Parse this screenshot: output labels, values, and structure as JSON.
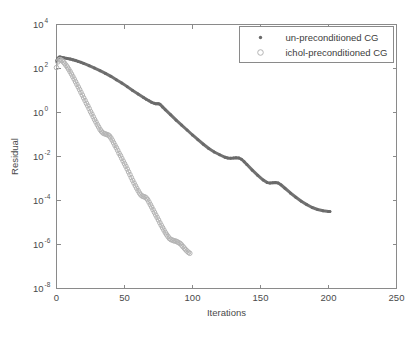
{
  "chart_data": {
    "type": "line",
    "title": "",
    "xlabel": "Iterations",
    "ylabel": "Residual",
    "yscale": "log",
    "xlim": [
      0,
      250
    ],
    "ylim": [
      1e-08,
      10000.0
    ],
    "xticks": [
      0,
      50,
      100,
      150,
      200,
      250
    ],
    "xticklabels": [
      "0",
      "50",
      "100",
      "150",
      "200",
      "250"
    ],
    "yticks": [
      10000,
      100,
      1,
      0.01,
      0.0001,
      1e-06,
      1e-08
    ],
    "yticklabels": [
      "10",
      "10",
      "10",
      "10",
      "10",
      "10",
      "10"
    ],
    "ytickexponents": [
      "4",
      "2",
      "0",
      "-2",
      "-4",
      "-6",
      "-8"
    ],
    "grid": false,
    "legend_position": "top-right",
    "legend_entries": [
      {
        "label": "un-preconditioned CG",
        "marker": "asterisk",
        "color": "#6a6a6a"
      },
      {
        "label": "ichol-preconditioned CG",
        "marker": "circle-open",
        "color": "#b4b4b4"
      }
    ],
    "series": [
      {
        "name": "un-preconditioned CG",
        "marker": "asterisk",
        "color": "#6a6a6a",
        "x": [
          0,
          1,
          2,
          3,
          4,
          5,
          6,
          8,
          10,
          12,
          14,
          16,
          18,
          20,
          24,
          28,
          32,
          36,
          40,
          44,
          48,
          52,
          56,
          60,
          64,
          66,
          68,
          70,
          72,
          73,
          74,
          75,
          76,
          78,
          80,
          84,
          88,
          92,
          96,
          100,
          104,
          108,
          112,
          116,
          120,
          124,
          126,
          128,
          130,
          132,
          134,
          136,
          138,
          140,
          144,
          148,
          152,
          155,
          157,
          159,
          161,
          163,
          165,
          168,
          172,
          176,
          180,
          184,
          188,
          192,
          196,
          200,
          201
        ],
        "y": [
          220.0,
          290.0,
          330.0,
          330.0,
          320.0,
          310.0,
          300.0,
          285.0,
          270.0,
          250.0,
          230.0,
          210.0,
          190.0,
          170.0,
          135.0,
          105.0,
          80.0,
          60.0,
          44.0,
          31.0,
          22.0,
          15.0,
          10.0,
          7.0,
          4.8,
          4.0,
          3.4,
          2.9,
          2.6,
          2.5,
          2.5,
          2.5,
          2.4,
          1.8,
          1.35,
          0.78,
          0.45,
          0.27,
          0.16,
          0.095,
          0.058,
          0.036,
          0.023,
          0.016,
          0.012,
          0.0092,
          0.0086,
          0.0084,
          0.0085,
          0.0088,
          0.0086,
          0.0075,
          0.0058,
          0.0043,
          0.0024,
          0.0014,
          0.00085,
          0.00065,
          0.00062,
          0.00064,
          0.00066,
          0.00062,
          0.00052,
          0.00036,
          0.00022,
          0.00014,
          9.2e-05,
          6.5e-05,
          4.8e-05,
          3.9e-05,
          3.4e-05,
          3.2e-05,
          3.2e-05
        ]
      },
      {
        "name": "ichol-preconditioned CG",
        "marker": "circle-open",
        "color": "#b4b4b4",
        "x": [
          0,
          1,
          2,
          3,
          4,
          5,
          6,
          7,
          8,
          9,
          10,
          11,
          12,
          13,
          14,
          15,
          16,
          17,
          18,
          19,
          20,
          21,
          22,
          23,
          24,
          25,
          26,
          27,
          28,
          29,
          30,
          31,
          32,
          33,
          34,
          35,
          36,
          37,
          38,
          39,
          40,
          41,
          42,
          43,
          44,
          45,
          46,
          47,
          48,
          49,
          50,
          51,
          52,
          53,
          54,
          55,
          56,
          57,
          58,
          59,
          60,
          61,
          62,
          63,
          64,
          65,
          66,
          67,
          68,
          69,
          70,
          71,
          72,
          73,
          74,
          75,
          76,
          77,
          78,
          79,
          80,
          81,
          82,
          83,
          84,
          85,
          86,
          87,
          88,
          89,
          90,
          91,
          92,
          93,
          94,
          95,
          96,
          97,
          98
        ],
        "y": [
          110.0,
          200.0,
          250.0,
          250.0,
          230.0,
          200.0,
          170.0,
          140.0,
          115.0,
          92.0,
          72.0,
          56.0,
          43.0,
          33.0,
          25.0,
          19.0,
          14.5,
          11.0,
          8.2,
          6.2,
          4.6,
          3.5,
          2.6,
          2.0,
          1.5,
          1.1,
          0.85,
          0.64,
          0.48,
          0.37,
          0.28,
          0.22,
          0.17,
          0.14,
          0.12,
          0.11,
          0.105,
          0.1,
          0.095,
          0.085,
          0.07,
          0.055,
          0.042,
          0.032,
          0.025,
          0.019,
          0.014,
          0.011,
          0.0082,
          0.0062,
          0.0047,
          0.0036,
          0.0027,
          0.002,
          0.0015,
          0.0011,
          0.00082,
          0.00062,
          0.00047,
          0.00036,
          0.00028,
          0.00022,
          0.00018,
          0.00016,
          0.00015,
          0.000145,
          0.00013,
          0.00011,
          8.5e-05,
          6.5e-05,
          5e-05,
          3.8e-05,
          2.9e-05,
          2.2e-05,
          1.7e-05,
          1.3e-05,
          9.8e-06,
          7.5e-06,
          5.8e-06,
          4.5e-06,
          3.5e-06,
          2.8e-06,
          2.3e-06,
          1.9e-06,
          1.7e-06,
          1.6e-06,
          1.5e-06,
          1.45e-06,
          1.4e-06,
          1.3e-06,
          1.2e-06,
          1.1e-06,
          9.5e-07,
          8e-07,
          6.8e-07,
          5.8e-07,
          5e-07,
          4.4e-07,
          4e-07
        ]
      }
    ]
  }
}
